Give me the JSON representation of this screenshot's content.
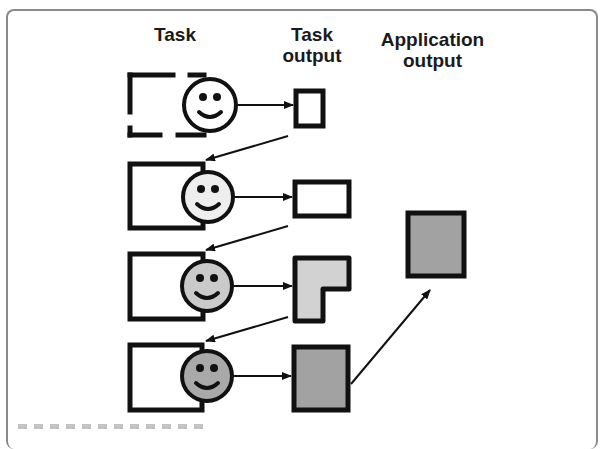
{
  "diagram": {
    "headers": {
      "task": "Task",
      "task_output": "Task\noutput",
      "task_output_line1": "Task",
      "task_output_line2": "output",
      "application_output_line1": "Application",
      "application_output_line2": "output"
    },
    "colors": {
      "stroke": "#111111",
      "frame": "#8a8a8a",
      "app_output_fill": "#a2a2a2"
    },
    "rows": [
      {
        "task_box": "dashed",
        "face_fill": "#ffffff",
        "output_shape": "small-rect",
        "output_fill": "#ffffff"
      },
      {
        "task_box": "solid",
        "face_fill": "#eeeeee",
        "output_shape": "wide-rect",
        "output_fill": "#ffffff"
      },
      {
        "task_box": "solid",
        "face_fill": "#cacaca",
        "output_shape": "L-shape",
        "output_fill": "#d2d2d2"
      },
      {
        "task_box": "solid",
        "face_fill": "#a9a9a9",
        "output_shape": "tall-rect",
        "output_fill": "#a2a2a2"
      }
    ],
    "application_output": {
      "shape": "tall-rect",
      "source_row": 4
    }
  }
}
